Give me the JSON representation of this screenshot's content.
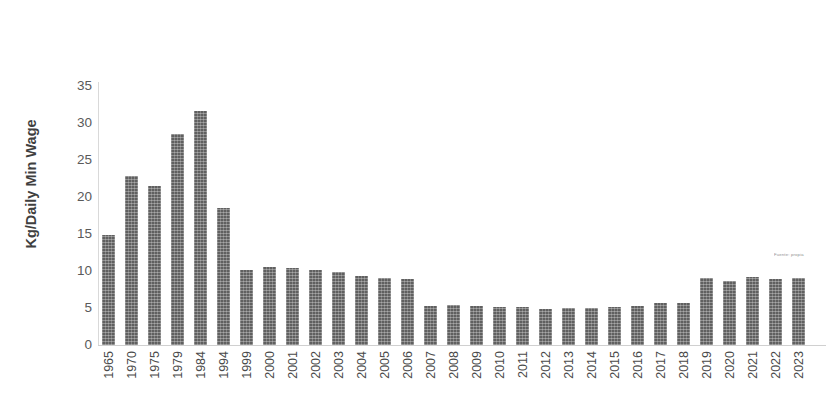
{
  "chart_data": {
    "type": "bar",
    "title": "",
    "subtitle": "",
    "xlabel": "",
    "ylabel": "Kg/Daily Min Wage",
    "ylim": [
      0,
      35
    ],
    "ytick_values": [
      0,
      5,
      10,
      15,
      20,
      25,
      30,
      35
    ],
    "ytick_labels": [
      "0",
      "5",
      "10",
      "15",
      "20",
      "25",
      "30",
      "35"
    ],
    "grid": false,
    "legend": null,
    "bar_color": "#606060",
    "bar_fill_pattern": "crosshatch",
    "categories": [
      "1965",
      "1970",
      "1975",
      "1979",
      "1984",
      "1994",
      "1999",
      "2000",
      "2001",
      "2002",
      "2003",
      "2004",
      "2005",
      "2006",
      "2007",
      "2008",
      "2009",
      "2010",
      "2011",
      "2012",
      "2013",
      "2014",
      "2015",
      "2016",
      "2017",
      "2018",
      "2019",
      "2020",
      "2021",
      "2022",
      "2023"
    ],
    "values": [
      14.8,
      22.9,
      21.5,
      28.5,
      31.6,
      18.5,
      10.2,
      10.5,
      10.4,
      10.2,
      9.8,
      9.3,
      9.1,
      8.9,
      5.3,
      5.4,
      5.3,
      5.2,
      5.1,
      4.8,
      5.0,
      5.0,
      5.1,
      5.3,
      5.7,
      5.7,
      9.0,
      8.7,
      9.2,
      8.9,
      9.0
    ],
    "annotations": [
      {
        "name": "source-watermark",
        "text": "Fuente: propia",
        "x": "2021",
        "y": 11.5
      }
    ]
  }
}
